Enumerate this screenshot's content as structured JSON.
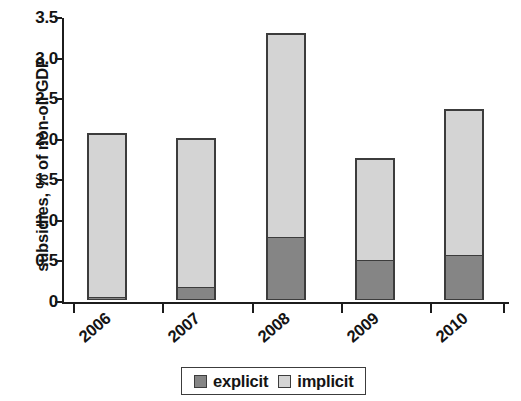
{
  "chart_data": {
    "type": "bar",
    "subtype": "stacked-vertical",
    "title": "",
    "xlabel": "",
    "ylabel": "subsidies, % of non-oil GDP",
    "categories": [
      "2006",
      "2007",
      "2008",
      "2009",
      "2010"
    ],
    "series": [
      {
        "name": "explicit",
        "color": "#858585",
        "values": [
          0.04,
          0.16,
          0.78,
          0.49,
          0.56
        ]
      },
      {
        "name": "implicit",
        "color": "#d4d4d4",
        "values": [
          2.02,
          1.84,
          2.51,
          1.26,
          1.8
        ]
      }
    ],
    "totals": [
      2.06,
      2.0,
      3.29,
      1.75,
      2.36
    ],
    "ylim": [
      0,
      3.5
    ],
    "ytick_labels": [
      "0",
      "0.5",
      "1.0",
      "1.5",
      "2.0",
      "2.5",
      "3.0",
      "3.5"
    ],
    "ytick_values": [
      0,
      0.5,
      1.0,
      1.5,
      2.0,
      2.5,
      3.0,
      3.5
    ],
    "grid": false,
    "legend_position": "bottom",
    "legend_entries": [
      "explicit",
      "implicit"
    ],
    "xtick_rotation_degrees": -40
  },
  "axes": {
    "y_title": "subsidies, % of non-oil GDP"
  },
  "legend": {
    "items": [
      {
        "label": "explicit",
        "swatch": "#858585"
      },
      {
        "label": "implicit",
        "swatch": "#d4d4d4"
      }
    ]
  }
}
